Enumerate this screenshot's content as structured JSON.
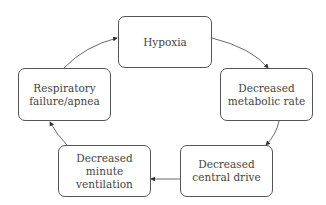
{
  "diagram": {
    "type": "cycle",
    "nodes": [
      {
        "id": "hypoxia",
        "lines": [
          "Hypoxia"
        ]
      },
      {
        "id": "metabolic",
        "lines": [
          "Decreased",
          "metabolic rate"
        ]
      },
      {
        "id": "central",
        "lines": [
          "Decreased",
          "central drive"
        ]
      },
      {
        "id": "ventilation",
        "lines": [
          "Decreased",
          "minute ventilation"
        ]
      },
      {
        "id": "respiratory",
        "lines": [
          "Respiratory",
          "failure/apnea"
        ]
      }
    ],
    "edges": [
      {
        "from": "hypoxia",
        "to": "metabolic"
      },
      {
        "from": "metabolic",
        "to": "central"
      },
      {
        "from": "central",
        "to": "ventilation"
      },
      {
        "from": "ventilation",
        "to": "respiratory"
      },
      {
        "from": "respiratory",
        "to": "hypoxia"
      }
    ]
  }
}
